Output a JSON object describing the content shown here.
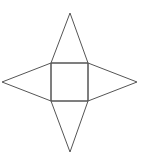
{
  "diagram": {
    "stroke_color": "#555555",
    "background": "#ffffff",
    "stroke_width": 1,
    "square": {
      "name": "base",
      "points": "51,63 88,63 88,101 51,101"
    },
    "triangles": [
      {
        "name": "face-top",
        "points": "51,63 70,13 88,63"
      },
      {
        "name": "face-right",
        "points": "88,63 137,82 88,101"
      },
      {
        "name": "face-bottom",
        "points": "51,101 70,152 88,101"
      },
      {
        "name": "face-left",
        "points": "51,63 2,82 51,101"
      }
    ]
  }
}
